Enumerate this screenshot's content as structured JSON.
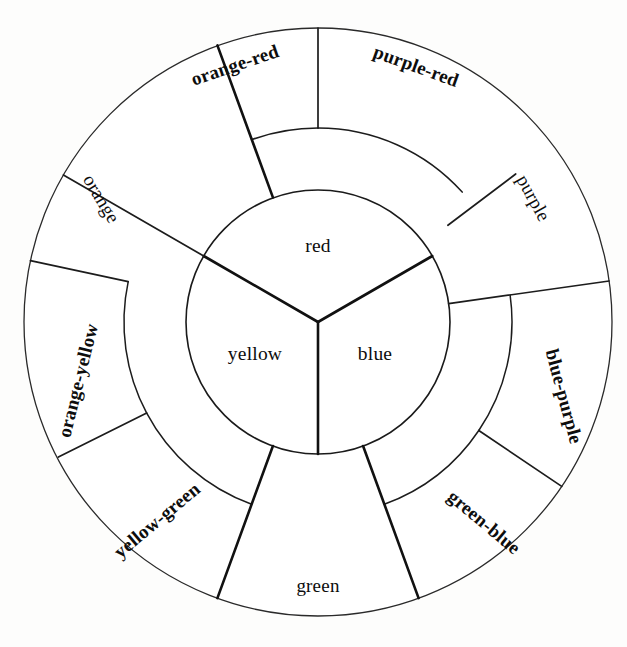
{
  "figure": {
    "kind": "color-wheel-diagram",
    "background_color": "#fdfdfc",
    "line_color": "#141414",
    "geometry": {
      "center_x": 318,
      "center_y": 322,
      "inner_circle_radius": 132,
      "middle_ring_radius": 194,
      "outer_circle_radius": 292
    }
  },
  "rings": {
    "primary": {
      "ring_name": "primary-ring",
      "segments": [
        {
          "label": "red",
          "start_angle": -90,
          "end_angle": 30
        },
        {
          "label": "blue",
          "start_angle": 30,
          "end_angle": 150
        },
        {
          "label": "yellow",
          "start_angle": 150,
          "end_angle": 270
        }
      ]
    },
    "secondary": {
      "ring_name": "secondary-ring",
      "segments": [
        {
          "label": "orange",
          "start_angle": -150,
          "end_angle": -110
        },
        {
          "label": "green",
          "start_angle": 70,
          "end_angle": 110
        },
        {
          "label": "purple",
          "start_angle": -48,
          "end_angle": -8
        }
      ]
    },
    "tertiary": {
      "ring_name": "tertiary-ring",
      "segments": [
        {
          "label": "purple-red",
          "start_angle": -90,
          "end_angle": -48
        },
        {
          "label": "orange-red",
          "start_angle": -110,
          "end_angle": -90
        },
        {
          "label": "blue-purple",
          "start_angle": -8,
          "end_angle": 34
        },
        {
          "label": "green-blue",
          "start_angle": 34,
          "end_angle": 70
        },
        {
          "label": "yellow-green",
          "start_angle": 110,
          "end_angle": 152
        },
        {
          "label": "orange-yellow",
          "start_angle": 152,
          "end_angle": 192
        }
      ]
    }
  },
  "labels": {
    "red": "red",
    "blue": "blue",
    "yellow": "yellow",
    "orange": "orange",
    "green": "green",
    "purple": "purple",
    "purple_red": "purple-red",
    "orange_red": "orange-red",
    "blue_purple": "blue-purple",
    "green_blue": "green-blue",
    "yellow_green": "yellow-green",
    "orange_yellow": "orange-yellow"
  }
}
